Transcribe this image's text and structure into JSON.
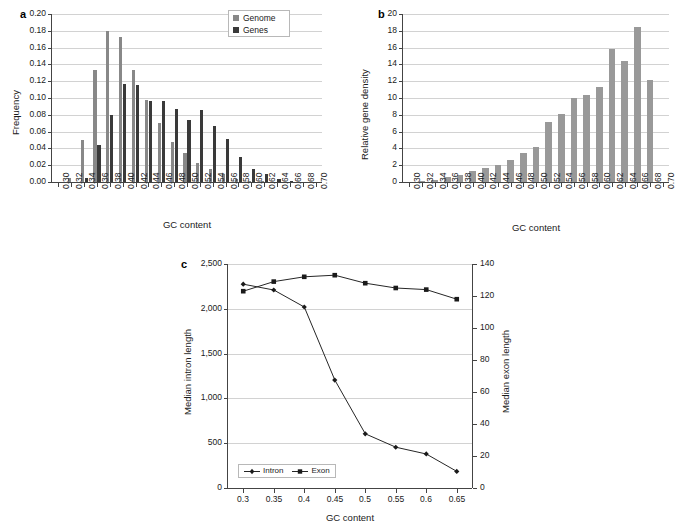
{
  "figure": {
    "panels": [
      "a",
      "b",
      "c"
    ]
  },
  "panel_a": {
    "letter": "a",
    "ylabel": "Frequency",
    "xlabel": "GC content",
    "legend": [
      {
        "label": "Genome",
        "color": "#888888"
      },
      {
        "label": "Genes",
        "color": "#3a3a3a"
      }
    ],
    "ytick_labels": [
      "0.00",
      "0.02",
      "0.04",
      "0.06",
      "0.08",
      "0.10",
      "0.12",
      "0.14",
      "0.16",
      "0.18",
      "0.20"
    ],
    "xtick_labels": [
      "0.30",
      "0.32",
      "0.34",
      "0.36",
      "0.38",
      "0.40",
      "0.42",
      "0.44",
      "0.46",
      "0.48",
      "0.50",
      "0.52",
      "0.54",
      "0.56",
      "0.58",
      "0.60",
      "0.62",
      "0.64",
      "0.66",
      "0.68",
      "0.70"
    ]
  },
  "panel_b": {
    "letter": "b",
    "ylabel": "Relative gene density",
    "xlabel": "GC content",
    "bar_color": "#999999",
    "ytick_labels": [
      "0",
      "2",
      "4",
      "6",
      "8",
      "10",
      "12",
      "14",
      "16",
      "18",
      "20"
    ],
    "xtick_labels": [
      "0.30",
      "0.32",
      "0.34",
      "0.36",
      "0.38",
      "0.40",
      "0.42",
      "0.44",
      "0.46",
      "0.48",
      "0.50",
      "0.52",
      "0.54",
      "0.56",
      "0.58",
      "0.60",
      "0.62",
      "0.64",
      "0.66",
      "0.68",
      "0.70"
    ]
  },
  "panel_c": {
    "letter": "c",
    "ylabel_left": "Median intron length",
    "ylabel_right": "Median exon length",
    "xlabel": "GC content",
    "legend": [
      {
        "label": "Intron",
        "marker": "diamond"
      },
      {
        "label": "Exon",
        "marker": "square"
      }
    ],
    "ytick_labels_left": [
      "0",
      "500",
      "1,000",
      "1,500",
      "2,000",
      "2,500"
    ],
    "ytick_labels_right": [
      "0",
      "20",
      "40",
      "60",
      "80",
      "100",
      "120",
      "140"
    ],
    "xtick_labels": [
      "0.3",
      "0.35",
      "0.4",
      "0.45",
      "0.5",
      "0.55",
      "0.6",
      "0.65"
    ]
  },
  "chart_data": [
    {
      "panel": "a",
      "type": "bar",
      "title": "",
      "xlabel": "GC content",
      "ylabel": "Frequency",
      "ylim": [
        0.0,
        0.2
      ],
      "grid": true,
      "legend_position": "top-right",
      "categories": [
        "0.30",
        "0.32",
        "0.34",
        "0.36",
        "0.38",
        "0.40",
        "0.42",
        "0.44",
        "0.46",
        "0.48",
        "0.50",
        "0.52",
        "0.54",
        "0.56",
        "0.58",
        "0.60",
        "0.62",
        "0.64",
        "0.66",
        "0.68",
        "0.70"
      ],
      "series": [
        {
          "name": "Genome",
          "color": "#888888",
          "values": [
            0.0,
            0.005,
            0.05,
            0.133,
            0.18,
            0.173,
            0.133,
            0.098,
            0.07,
            0.048,
            0.034,
            0.023,
            0.015,
            0.009,
            0.004,
            0.001,
            0.001,
            0.0,
            0.0,
            0.0,
            0.0
          ]
        },
        {
          "name": "Genes",
          "color": "#3a3a3a",
          "values": [
            0.0,
            0.0,
            0.005,
            0.044,
            0.08,
            0.117,
            0.115,
            0.097,
            0.096,
            0.087,
            0.074,
            0.086,
            0.067,
            0.051,
            0.03,
            0.015,
            0.01,
            0.004,
            0.001,
            0.0,
            0.0
          ]
        }
      ]
    },
    {
      "panel": "b",
      "type": "bar",
      "title": "",
      "xlabel": "GC content",
      "ylabel": "Relative gene density",
      "ylim": [
        0,
        20
      ],
      "grid": true,
      "categories": [
        "0.30",
        "0.32",
        "0.34",
        "0.36",
        "0.38",
        "0.40",
        "0.42",
        "0.44",
        "0.46",
        "0.48",
        "0.50",
        "0.52",
        "0.54",
        "0.56",
        "0.58",
        "0.60",
        "0.62",
        "0.64",
        "0.66",
        "0.68",
        "0.70"
      ],
      "values": [
        0.0,
        0.05,
        0.2,
        0.6,
        0.85,
        1.3,
        1.7,
        2.0,
        2.65,
        3.5,
        4.2,
        7.1,
        8.05,
        10.0,
        10.3,
        11.3,
        15.8,
        14.4,
        18.5,
        12.1,
        0.0
      ]
    },
    {
      "panel": "c",
      "type": "line",
      "title": "",
      "xlabel": "GC content",
      "ylabel": "Median intron length",
      "ylabel_right": "Median exon length",
      "x": [
        0.3,
        0.35,
        0.4,
        0.45,
        0.5,
        0.55,
        0.6,
        0.65
      ],
      "ylim": [
        0,
        2500
      ],
      "ylim_right": [
        0,
        140
      ],
      "grid": true,
      "legend_position": "bottom-left",
      "series": [
        {
          "name": "Intron",
          "axis": "left",
          "marker": "diamond",
          "values": [
            2275,
            2210,
            2020,
            1205,
            605,
            455,
            380,
            185
          ]
        },
        {
          "name": "Exon",
          "axis": "right",
          "marker": "square",
          "values": [
            123,
            129,
            132,
            133,
            128,
            125,
            124,
            118
          ]
        }
      ]
    }
  ]
}
